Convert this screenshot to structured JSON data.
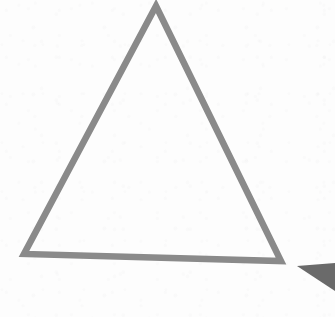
{
  "canvas": {
    "width": 335,
    "height": 317,
    "background_color": "#fdfdfd",
    "texture": "faint-paper-grain"
  },
  "figure": {
    "shapes": [
      {
        "name": "outlined-triangle",
        "kind": "triangle",
        "style": "stroke-only",
        "stroke_color": "#8a8a8a",
        "stroke_width": 6.5,
        "fill": "none",
        "rotation_note": "tilted slightly clockwise",
        "points": "156,6 281,261 24,254",
        "vertices": [
          {
            "label": "apex",
            "x": 156,
            "y": 6
          },
          {
            "label": "bottom-right",
            "x": 281,
            "y": 261
          },
          {
            "label": "bottom-left",
            "x": 24,
            "y": 254
          }
        ]
      },
      {
        "name": "corner-wedge",
        "kind": "triangle",
        "style": "filled",
        "fill_color": "#6a6a6a",
        "stroke": "none",
        "points": "297,266 335,263 335,291",
        "vertices": [
          {
            "label": "tip-left",
            "x": 297,
            "y": 266
          },
          {
            "label": "top-right",
            "x": 335,
            "y": 263
          },
          {
            "label": "bottom-right",
            "x": 335,
            "y": 291
          }
        ]
      }
    ]
  },
  "colors": {
    "background": "#fdfdfd",
    "triangle_stroke": "#8a8a8a",
    "wedge_fill": "#6a6a6a"
  }
}
